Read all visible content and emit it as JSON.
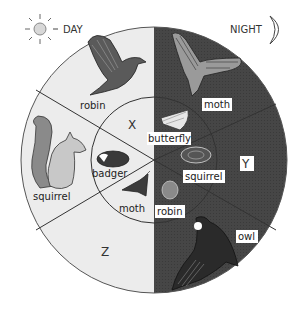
{
  "header": {
    "day_label": "DAY",
    "night_label": "NIGHT",
    "day_icon": "sun-icon",
    "night_icon": "moon-icon",
    "day_prefix": "-",
    "day_dash": "-"
  },
  "colors": {
    "day_fill": "#ececec",
    "night_fill": "#454545",
    "line": "#333333",
    "label_bg": "#ffffff"
  },
  "zones": {
    "x": "X",
    "y": "Y",
    "z": "Z"
  },
  "day_side": {
    "outer": [
      {
        "label": "robin",
        "icon": "robin-flying-icon"
      },
      {
        "label": "squirrel",
        "icon": "squirrel-icon"
      }
    ],
    "inner": [
      {
        "label": "badger",
        "icon": "badger-icon"
      },
      {
        "label": "moth",
        "icon": "moth-resting-icon"
      }
    ]
  },
  "night_side": {
    "outer": [
      {
        "label": "moth",
        "icon": "hawk-moth-icon"
      },
      {
        "label": "owl",
        "icon": "owl-flying-icon"
      }
    ],
    "inner": [
      {
        "label": "butterfly",
        "icon": "butterfly-icon"
      },
      {
        "label": "squirrel",
        "icon": "curled-squirrel-icon"
      },
      {
        "label": "robin",
        "icon": "sleeping-robin-icon"
      }
    ]
  }
}
